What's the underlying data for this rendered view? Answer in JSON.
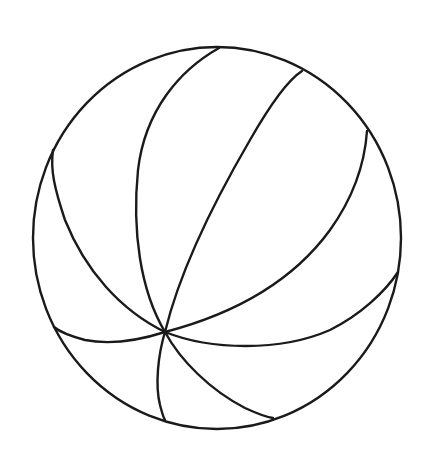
{
  "image": {
    "subject": "beach ball line drawing",
    "background_color": "#ffffff",
    "stroke_color": "#1a1a1a",
    "stroke_width": 2.4
  },
  "ball": {
    "outline": {
      "cx": 217,
      "cy": 238,
      "rx": 184,
      "ry": 191
    },
    "hub": {
      "x": 165,
      "y": 332
    },
    "seams": [
      {
        "name": "seam-top-left",
        "d": "M165 332 C 140 290, 132 230, 138 170 C 145 110, 180 70, 219 48"
      },
      {
        "name": "seam-top-right",
        "d": "M165 332 C 180 270, 215 200, 250 140 C 270 105, 288 80, 302 71"
      },
      {
        "name": "seam-left-upper",
        "d": "M165 332 C 120 310, 85 270, 65 220 C 55 190, 50 170, 53 150"
      },
      {
        "name": "seam-right-upper",
        "d": "M165 332 C 230 315, 290 285, 330 230 C 355 195, 365 160, 367 131"
      },
      {
        "name": "seam-right-lower",
        "d": "M165 332 C 210 350, 280 352, 330 330 C 360 315, 385 292, 398 272"
      },
      {
        "name": "seam-left-lower",
        "d": "M165 332 C 140 340, 110 345, 85 340 C 70 336, 60 332, 54 327"
      },
      {
        "name": "seam-bottom-left",
        "d": "M165 332 C 158 355, 155 385, 160 405 C 162 412, 163 417, 165 420"
      },
      {
        "name": "seam-bottom-right",
        "d": "M165 332 C 180 360, 210 390, 245 408 C 258 414, 266 417, 273 418"
      }
    ]
  }
}
